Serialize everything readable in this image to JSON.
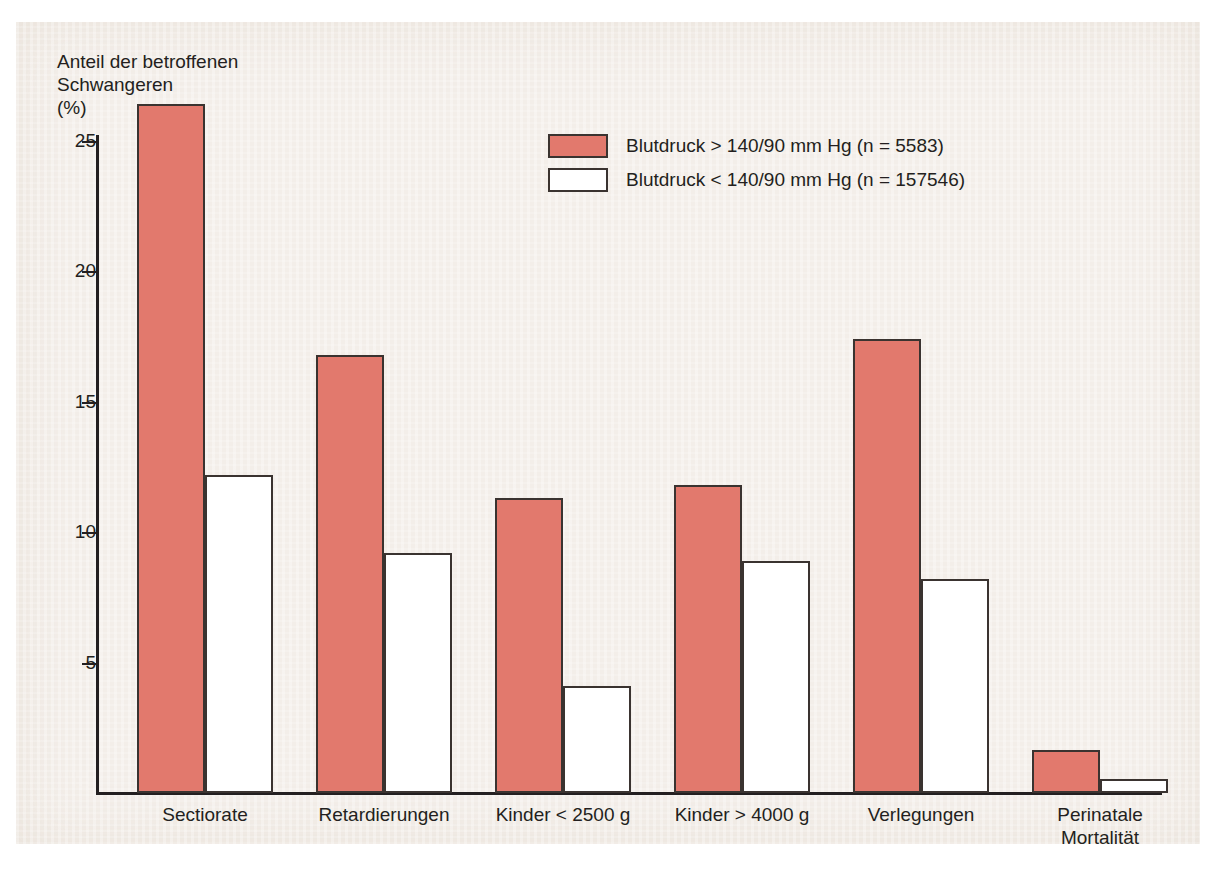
{
  "axis": {
    "y_caption": "Anteil der betroffenen\nSchwangeren\n(%)",
    "y_ticks": [
      "25",
      "20",
      "15",
      "10",
      "5"
    ]
  },
  "legend": {
    "items": [
      {
        "label": "Blutdruck > 140/90 mm Hg (n = 5583)",
        "color": "#e2796d",
        "swatch": "red"
      },
      {
        "label": "Blutdruck < 140/90 mm Hg (n = 157546)",
        "color": "#ffffff",
        "swatch": "white"
      }
    ]
  },
  "categories": [
    "Sectiorate",
    "Retardierungen",
    "Kinder < 2500 g",
    "Kinder > 4000 g",
    "Verlegungen",
    "Perinatale\nMortalität"
  ],
  "chart_data": {
    "type": "bar",
    "title": "",
    "xlabel": "",
    "ylabel": "Anteil der betroffenen Schwangeren (%)",
    "ylim": [
      0,
      26.5
    ],
    "yticks": [
      5,
      10,
      15,
      20,
      25
    ],
    "grid": false,
    "legend_position": "top-center",
    "categories": [
      "Sectiorate",
      "Retardierungen",
      "Kinder < 2500 g",
      "Kinder > 4000 g",
      "Verlegungen",
      "Perinatale Mortalität"
    ],
    "series": [
      {
        "name": "Blutdruck > 140/90 mm Hg (n = 5583)",
        "color": "#e2796d",
        "values": [
          26.4,
          16.8,
          11.3,
          11.8,
          17.4,
          1.65
        ]
      },
      {
        "name": "Blutdruck < 140/90 mm Hg (n = 157546)",
        "color": "#ffffff",
        "values": [
          12.2,
          9.2,
          4.1,
          8.9,
          8.2,
          0.55
        ]
      }
    ]
  },
  "geometry": {
    "baseline_y": 793,
    "px_per_unit": 26.1,
    "bar_width": 68,
    "group_left": [
      137,
      316,
      495,
      674,
      853,
      1032
    ],
    "bar_gap": 0,
    "label_centers": [
      205,
      384,
      563,
      742,
      921,
      1100
    ]
  }
}
